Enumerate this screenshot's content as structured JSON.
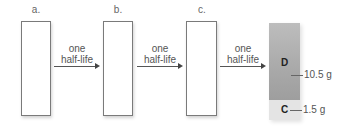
{
  "diagram": {
    "type": "radioactive-decay-half-life-sequence",
    "stages": [
      {
        "label": "a."
      },
      {
        "label": "b."
      },
      {
        "label": "c."
      }
    ],
    "arrows": [
      {
        "line1": "one",
        "line2": "half-life"
      },
      {
        "line1": "one",
        "line2": "half-life"
      },
      {
        "line1": "one",
        "line2": "half-life"
      }
    ],
    "final_sample": {
      "segments": [
        {
          "letter": "D",
          "mass": "10.5 g",
          "color": "#a9a9a9"
        },
        {
          "letter": "C",
          "mass": "1.5 g",
          "color": "#e4e4e4"
        }
      ]
    }
  }
}
